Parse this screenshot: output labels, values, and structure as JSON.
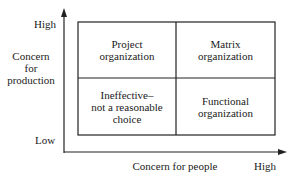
{
  "y_axis": {
    "high": "High",
    "low": "Low",
    "title_lines": [
      "Concern",
      "for",
      "production"
    ]
  },
  "x_axis": {
    "title": "Concern for people",
    "high": "High"
  },
  "quadrants": {
    "top_left": [
      "Project",
      "organization"
    ],
    "top_right": [
      "Matrix",
      "organization"
    ],
    "bottom_left": [
      "Ineffective–",
      "not a reasonable",
      "choice"
    ],
    "bottom_right": [
      "Functional",
      "organization"
    ]
  }
}
